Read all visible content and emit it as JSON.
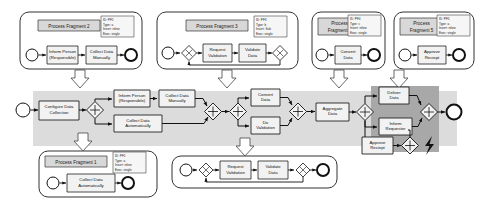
{
  "diagram": {
    "type": "bpmn-process-diagram",
    "colors": {
      "page_background": "#ffffff",
      "fragment_fill": "#ffffff",
      "fragment_stroke": "#333333",
      "fragment_title_fill": "#d8d8d8",
      "main_band_fill": "#dcdcdc",
      "highlight_region_fill": "#a8a8a8",
      "task_fill": "#f2f2f2",
      "task_stroke": "#222222",
      "annotation_fill": "#f6f6f6",
      "event_stroke": "#111111",
      "flow_stroke": "#111111",
      "insertion_arrow_fill": "#ffffff",
      "insertion_arrow_stroke": "#444444"
    },
    "fragments": [
      {
        "id": "fragment-2",
        "title": "Process Fragment 2",
        "position": "top-left",
        "annotation": {
          "id_line": "ID: PF2",
          "type_line": "Type: a",
          "insert_line": "Insert: inline",
          "exec_line": "Exec: single"
        },
        "start_event": "start",
        "end_event": "end",
        "tasks": [
          {
            "label_line1": "Inform Person",
            "label_line2": "(Responsible)"
          },
          {
            "label_line1": "Collect Data",
            "label_line2": "Manually"
          }
        ],
        "gateways": []
      },
      {
        "id": "fragment-3",
        "title": "Process Fragment 3",
        "position": "top-center",
        "annotation": {
          "id_line": "ID: PF3",
          "type_line": "Type: b",
          "insert_line": "Insert: Sub",
          "exec_line": "Exec: single"
        },
        "start_event": "start",
        "end_event": "end",
        "tasks": [
          {
            "label_line1": "Request",
            "label_line2": "Validation"
          },
          {
            "label_line1": "Validate",
            "label_line2": "Data"
          }
        ],
        "gateways": [
          "xor-split",
          "xor-join"
        ]
      },
      {
        "id": "fragment-4",
        "title_line1": "Process",
        "title_line2": "Fragment 4",
        "title": "Process Fragment 4",
        "position": "top-right",
        "annotation": {
          "id_line": "ID: PF4",
          "type_line": "Type: c",
          "insert_line": "Insert: inline",
          "exec_line": "Exec: single"
        },
        "start_event": "start",
        "end_event": "end",
        "tasks": [
          {
            "label_line1": "Convert",
            "label_line2": "Data"
          }
        ],
        "gateways": []
      },
      {
        "id": "fragment-5",
        "title_line1": "Process",
        "title_line2": "Fragment 5",
        "title": "Process Fragment 5",
        "position": "top-far-right",
        "annotation": {
          "id_line": "ID: PF5",
          "type_line": "Type: a",
          "insert_line": "Insert: inline",
          "exec_line": "Exec: single"
        },
        "start_event": "start",
        "end_event": "end",
        "tasks": [
          {
            "label_line1": "Approve",
            "label_line2": "Reciept"
          }
        ],
        "gateways": []
      },
      {
        "id": "fragment-1",
        "title": "Process Fragment 1",
        "position": "bottom-left",
        "annotation": {
          "id_line": "ID: PF1",
          "type_line": "Type: a",
          "insert_line": "Insert: inline",
          "exec_line": "Exec: single"
        },
        "start_event": "start",
        "end_event": "end",
        "tasks": [
          {
            "label_line1": "Collect Data",
            "label_line2": "Automatically"
          }
        ],
        "gateways": []
      },
      {
        "id": "fragment-sub",
        "title": "",
        "position": "bottom-center",
        "annotation": null,
        "start_event": "start",
        "end_event": "end",
        "tasks": [
          {
            "label_line1": "Request",
            "label_line2": "Validation"
          },
          {
            "label_line1": "Validate",
            "label_line2": "Data"
          }
        ],
        "gateways": [
          "xor-split",
          "xor-join"
        ]
      }
    ],
    "main_process": {
      "id": "main-process",
      "start_event": "start",
      "end_event": "end",
      "tasks": [
        {
          "id": "configure-data-collection",
          "label_line1": "Configure Data",
          "label_line2": "Collection"
        },
        {
          "id": "inform-person-responsible",
          "label_line1": "Inform Person",
          "label_line2": "(Responsible)"
        },
        {
          "id": "collect-data-manually",
          "label_line1": "Collect Data",
          "label_line2": "Manually"
        },
        {
          "id": "collect-data-automatically",
          "label_line1": "Collect Data",
          "label_line2": "Automatically"
        },
        {
          "id": "convert-data",
          "label_line1": "Convert",
          "label_line2": "Data"
        },
        {
          "id": "do-validation",
          "label_line1": "Do",
          "label_line2": "Validation"
        },
        {
          "id": "aggregate-data",
          "label_line1": "Aggregate",
          "label_line2": "Data"
        },
        {
          "id": "deliver-data",
          "label_line1": "Deliver",
          "label_line2": "Data"
        },
        {
          "id": "inform-requestor",
          "label_line1": "Inform",
          "label_line2": "Requestor"
        },
        {
          "id": "approve-reciept",
          "label_line1": "Approve",
          "label_line2": "Reciept"
        }
      ],
      "gateways": [
        {
          "id": "and-split-1",
          "symbol": "+"
        },
        {
          "id": "and-join-1",
          "symbol": "+"
        },
        {
          "id": "and-split-2",
          "symbol": "+"
        },
        {
          "id": "and-join-2",
          "symbol": "+"
        },
        {
          "id": "and-split-3",
          "symbol": "+"
        },
        {
          "id": "and-join-3",
          "symbol": "+"
        },
        {
          "id": "and-join-4",
          "symbol": "+"
        },
        {
          "id": "and-join-5",
          "symbol": "+"
        }
      ],
      "highlight_region_label": "",
      "event_marker": "lightning-bolt"
    },
    "insertion_arrows": [
      {
        "id": "insertion-arrow-fragment-2",
        "direction": "down"
      },
      {
        "id": "insertion-arrow-fragment-3",
        "direction": "down"
      },
      {
        "id": "insertion-arrow-fragment-4",
        "direction": "down"
      },
      {
        "id": "insertion-arrow-fragment-5",
        "direction": "down"
      },
      {
        "id": "insertion-arrow-fragment-1",
        "direction": "up"
      },
      {
        "id": "insertion-arrow-fragment-sub",
        "direction": "up"
      }
    ]
  }
}
